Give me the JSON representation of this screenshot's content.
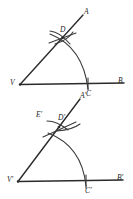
{
  "figure": {
    "background_color": "#ffffff",
    "ink_color": "#2b2b2b",
    "panels": [
      {
        "name": "original-angle",
        "vertex_label": "V",
        "ray_upper_label": "A",
        "ray_lower_label": "B",
        "arc_base_label": "C",
        "arc_upper_label": "D"
      },
      {
        "name": "copied-angle",
        "vertex_label": "V'",
        "ray_upper_label": "A'",
        "ray_lower_label": "B'",
        "arc_base_label": "C'",
        "arc_upper_label": "D'",
        "extra_label": "E'"
      }
    ]
  },
  "labels": {
    "top": {
      "A": "A",
      "B": "B",
      "C": "C",
      "D": "D",
      "V": "V"
    },
    "bottom": {
      "A_prime": "A'",
      "B_prime": "B'",
      "C_prime": "C'",
      "D_prime": "D'",
      "E_prime": "E'",
      "V_prime": "V'"
    }
  }
}
